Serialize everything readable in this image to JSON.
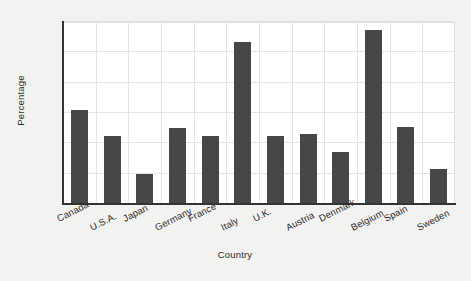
{
  "chart_data": {
    "type": "bar",
    "title": "",
    "xlabel": "Country",
    "ylabel": "Percentage",
    "categories": [
      "Canada",
      "U.S.A.",
      "Japan",
      "Germany",
      "France",
      "Italy",
      "U.K.",
      "Austria",
      "Denmark",
      "Belgium",
      "Spain",
      "Sweden"
    ],
    "values": [
      62,
      45,
      20,
      50,
      45,
      107,
      45,
      46,
      34,
      115,
      51,
      23
    ],
    "ylim": [
      0,
      120
    ],
    "yticks": [
      0,
      20,
      40,
      60,
      80,
      100,
      120
    ],
    "ytick_labels": [
      "0",
      "20",
      "40",
      "60",
      "80",
      "100",
      "120"
    ],
    "grid": "both",
    "legend": "none",
    "bar_color": "#474747",
    "plot_background": "#ffffff",
    "figure_background": "#f2f2f0",
    "grid_color": "#e3e3e3",
    "axis_color": "#333333"
  }
}
